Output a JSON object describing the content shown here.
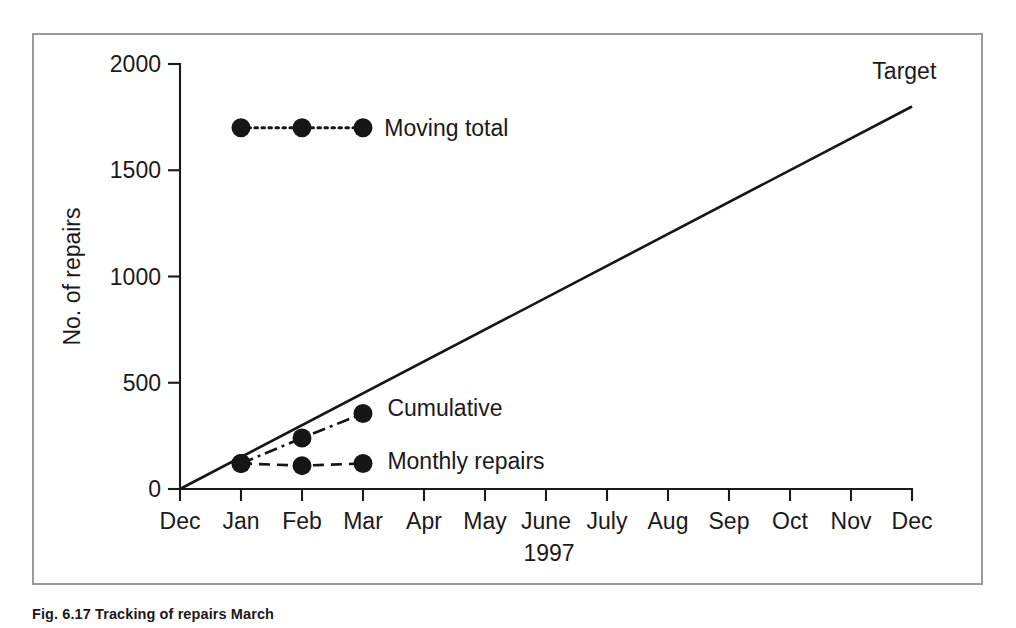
{
  "figure": {
    "caption": "Fig. 6.17  Tracking of repairs March",
    "border_color": "#9a9a9a",
    "ink_color": "#161616",
    "background": "#ffffff"
  },
  "chart_data": {
    "type": "line",
    "title": "",
    "xlabel": "1997",
    "ylabel": "No. of repairs",
    "ylim": [
      0,
      2000
    ],
    "yticks": [
      0,
      500,
      1000,
      1500,
      2000
    ],
    "ytick_labels": [
      "0",
      "500",
      "1000",
      "1500",
      "2000"
    ],
    "categories": [
      "Dec",
      "Jan",
      "Feb",
      "Mar",
      "Apr",
      "May",
      "June",
      "July",
      "Aug",
      "Sep",
      "Oct",
      "Nov",
      "Dec"
    ],
    "xtick_labels": [
      "Dec",
      "Jan",
      "Feb",
      "Mar",
      "Apr",
      "May",
      "June",
      "July",
      "Aug",
      "Sep",
      "Oct",
      "Nov",
      "Dec"
    ],
    "grid": false,
    "legend_position": "inline-annotations",
    "series": [
      {
        "name": "Target",
        "label": "Target",
        "linestyle": "solid",
        "marker": "none",
        "x": [
          "Dec",
          "Dec"
        ],
        "x_index": [
          0,
          12
        ],
        "values": [
          0,
          1800
        ],
        "annotation": "Target"
      },
      {
        "name": "Moving total",
        "label": "Moving total",
        "linestyle": "dotted",
        "marker": "circle",
        "x": [
          "Jan",
          "Feb",
          "Mar"
        ],
        "x_index": [
          1,
          2,
          3
        ],
        "values": [
          1700,
          1700,
          1700
        ],
        "annotation": "Moving total"
      },
      {
        "name": "Cumulative",
        "label": "Cumulative",
        "linestyle": "dashdot",
        "marker": "circle",
        "x": [
          "Jan",
          "Feb",
          "Mar"
        ],
        "x_index": [
          1,
          2,
          3
        ],
        "values": [
          120,
          240,
          355
        ],
        "annotation": "Cumulative"
      },
      {
        "name": "Monthly repairs",
        "label": "Monthly repairs",
        "linestyle": "dashed",
        "marker": "circle",
        "x": [
          "Jan",
          "Feb",
          "Mar"
        ],
        "x_index": [
          1,
          2,
          3
        ],
        "values": [
          120,
          110,
          120
        ],
        "annotation": "Monthly repairs"
      }
    ],
    "annotations": [
      {
        "text": "Target",
        "x_index": 11.35,
        "value": 1965
      },
      {
        "text": "Moving total",
        "x_index": 3.35,
        "value": 1700
      },
      {
        "text": "Cumulative",
        "x_index": 3.4,
        "value": 380
      },
      {
        "text": "Monthly repairs",
        "x_index": 3.4,
        "value": 130
      }
    ]
  }
}
